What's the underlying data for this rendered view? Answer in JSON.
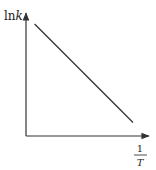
{
  "chart_data": {
    "type": "line",
    "title": "",
    "xlabel": {
      "numerator": "1",
      "denominator": "T"
    },
    "ylabel": {
      "prefix": "ln",
      "variable": "k"
    },
    "x_ticks": [],
    "y_ticks": [],
    "grid": false,
    "legend": "none",
    "xlim": [
      0,
      1
    ],
    "ylim": [
      0,
      1
    ],
    "series": [
      {
        "name": "lnk vs 1/T",
        "x": [
          0.07,
          0.87
        ],
        "y": [
          0.91,
          0.11
        ],
        "color": "#333333"
      }
    ]
  },
  "colors": {
    "axis": "#333333",
    "line": "#333333",
    "text": "#222222"
  }
}
